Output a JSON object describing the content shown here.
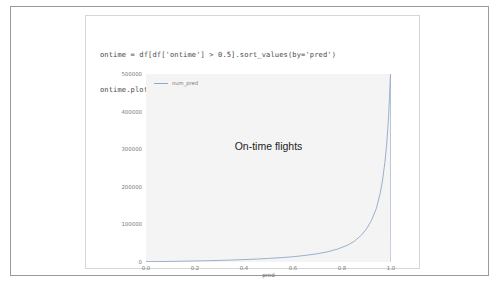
{
  "notebook": {
    "code_lines": [
      "ontime = df[df['ontime'] > 0.5].sort_values(by='pred')",
      "ontime.plot(x='pred', y='num_pred');"
    ]
  },
  "chart_data": {
    "type": "line",
    "title": "",
    "annotation": "On-time flights",
    "xlabel": "pred",
    "ylabel": "",
    "xlim": [
      0.0,
      1.0
    ],
    "ylim": [
      0,
      500000
    ],
    "grid": false,
    "legend_position": "upper left",
    "xticks": [
      "0.0",
      "0.2",
      "0.4",
      "0.6",
      "0.8",
      "1.0"
    ],
    "xtick_values": [
      0.0,
      0.2,
      0.4,
      0.6,
      0.8,
      1.0
    ],
    "yticks": [
      "0",
      "100000",
      "200000",
      "300000",
      "400000",
      "500000"
    ],
    "ytick_values": [
      0,
      100000,
      200000,
      300000,
      400000,
      500000
    ],
    "line_color": "#8fa8c8",
    "panel_color": "#f4f4f4",
    "series": [
      {
        "name": "num_pred",
        "x": [
          0.0,
          0.05,
          0.1,
          0.15,
          0.2,
          0.25,
          0.3,
          0.35,
          0.4,
          0.45,
          0.5,
          0.55,
          0.6,
          0.65,
          0.7,
          0.74,
          0.78,
          0.82,
          0.85,
          0.88,
          0.9,
          0.92,
          0.94,
          0.955,
          0.965,
          0.975,
          0.982,
          0.987,
          0.99,
          0.992,
          0.994,
          0.996,
          0.997,
          0.998,
          0.999,
          1.0
        ],
        "values": [
          900,
          1200,
          1600,
          2100,
          2700,
          3400,
          4200,
          5200,
          6400,
          7800,
          9500,
          11500,
          14000,
          17500,
          22000,
          27000,
          34000,
          44000,
          55000,
          72000,
          88000,
          110000,
          142000,
          180000,
          215000,
          265000,
          310000,
          355000,
          385000,
          412000,
          440000,
          470000,
          486000,
          496000,
          500000,
          0
        ]
      }
    ]
  }
}
